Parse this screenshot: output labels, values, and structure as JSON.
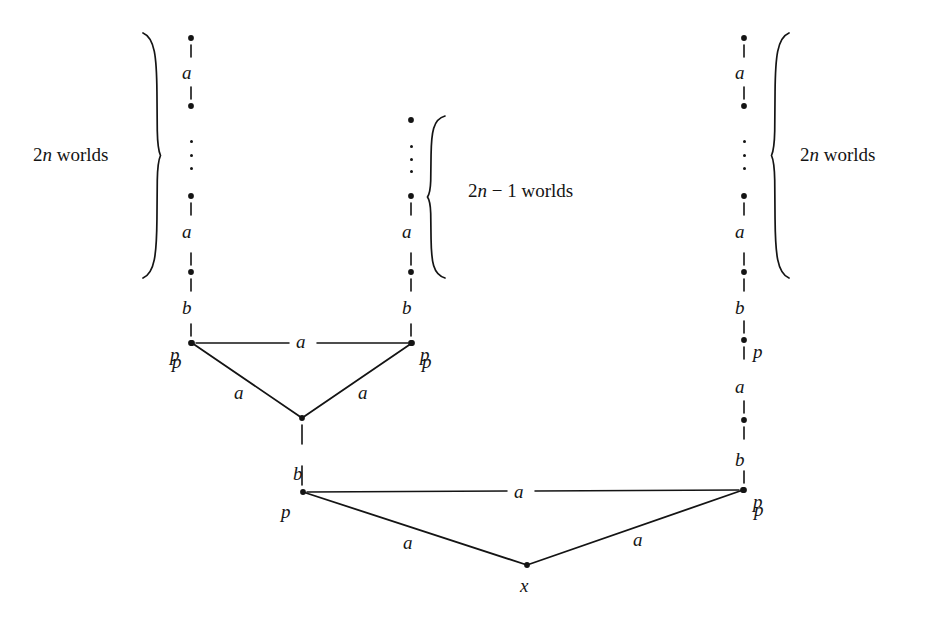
{
  "figure": {
    "type": "kripke-model-diagram",
    "background_color": "#ffffff",
    "ink_color": "#141414",
    "width": 932,
    "height": 628
  },
  "braces": [
    {
      "id": "left-brace",
      "label_parts": {
        "number": "2",
        "variable": "n",
        "word": "worlds"
      },
      "label_text": "2n worlds",
      "side": "right-of-label",
      "x": 160,
      "y_top": 33,
      "y_bottom": 278
    },
    {
      "id": "middle-brace",
      "label_parts": {
        "number": "2",
        "variable": "n",
        "minus": "−",
        "second": "1",
        "word": "worlds"
      },
      "label_text": "2n − 1 worlds",
      "side": "left-of-label",
      "x": 428,
      "y_top": 116,
      "y_bottom": 278
    },
    {
      "id": "right-brace",
      "label_parts": {
        "number": "2",
        "variable": "n",
        "word": "worlds"
      },
      "label_text": "2n worlds",
      "side": "left-of-label",
      "x": 772,
      "y_top": 33,
      "y_bottom": 278
    }
  ],
  "brace_labels": [
    {
      "id": "left-brace-label",
      "prefix": "2",
      "italic": "n",
      "suffix": " worlds",
      "x": 33,
      "y": 145
    },
    {
      "id": "middle-brace-label",
      "prefix": "2",
      "italic": "n",
      "suffix": " − 1 worlds",
      "x": 468,
      "y": 181
    },
    {
      "id": "right-brace-label",
      "prefix": "2",
      "italic": "n",
      "suffix": " worlds",
      "x": 800,
      "y": 145
    }
  ],
  "columns": {
    "left": {
      "id": "left-chain",
      "x": 191,
      "nodes": [
        {
          "y": 38
        },
        {
          "y": 106
        },
        {
          "y": 196
        },
        {
          "y": 272
        },
        {
          "y": 343,
          "label": "p",
          "label_side": "left"
        }
      ],
      "edge_labels": [
        {
          "text": "a",
          "x": 182,
          "y": 63
        },
        {
          "text": "a",
          "x": 182,
          "y": 222
        },
        {
          "text": "b",
          "x": 182,
          "y": 298
        }
      ],
      "dots_column": {
        "x": 189,
        "y": 140,
        "height": 30
      }
    },
    "middle": {
      "id": "middle-chain",
      "x": 411,
      "nodes": [
        {
          "y": 120
        },
        {
          "y": 196
        },
        {
          "y": 272
        },
        {
          "y": 343,
          "label": "p",
          "label_side": "right"
        }
      ],
      "edge_labels": [
        {
          "text": "a",
          "x": 402,
          "y": 222
        },
        {
          "text": "b",
          "x": 402,
          "y": 298
        }
      ],
      "dots_column": {
        "x": 409,
        "y": 145,
        "height": 28
      }
    },
    "right": {
      "id": "right-chain",
      "x": 744,
      "nodes": [
        {
          "y": 38
        },
        {
          "y": 106
        },
        {
          "y": 196
        },
        {
          "y": 272
        },
        {
          "y": 340,
          "label": "p",
          "label_side": "right"
        },
        {
          "y": 420
        },
        {
          "y": 490,
          "label": "p",
          "label_side": "right"
        }
      ],
      "edge_labels": [
        {
          "text": "a",
          "x": 735,
          "y": 63
        },
        {
          "text": "a",
          "x": 735,
          "y": 222
        },
        {
          "text": "b",
          "x": 735,
          "y": 298
        },
        {
          "text": "a",
          "x": 735,
          "y": 377
        },
        {
          "text": "b",
          "x": 735,
          "y": 450
        }
      ],
      "dots_column": {
        "x": 742,
        "y": 140,
        "height": 30
      }
    }
  },
  "vertices": [
    {
      "id": "upper-left-p",
      "x": 192,
      "y": 343,
      "label": "p",
      "label_x": 172,
      "label_y": 352
    },
    {
      "id": "upper-right-p",
      "x": 412,
      "y": 343,
      "label": "p",
      "label_x": 422,
      "label_y": 352
    },
    {
      "id": "upper-apex",
      "x": 302,
      "y": 418,
      "label": "",
      "label_x": 0,
      "label_y": 0
    },
    {
      "id": "lower-left-p",
      "x": 303,
      "y": 492,
      "label": "p",
      "label_x": 281,
      "label_y": 502
    },
    {
      "id": "lower-right-p",
      "x": 743,
      "y": 490,
      "label": "p",
      "label_x": 754,
      "label_y": 500
    },
    {
      "id": "bottom-x",
      "x": 527,
      "y": 565,
      "label": "x",
      "label_x": 520,
      "label_y": 576
    }
  ],
  "edges": [
    {
      "id": "upper-top-edge",
      "from": "upper-left-p",
      "to": "upper-right-p",
      "label": "a",
      "label_x": 296,
      "label_y": 332,
      "gap": 14
    },
    {
      "id": "upper-left-edge",
      "from": "upper-left-p",
      "to": "upper-apex",
      "label": "a",
      "label_x": 234,
      "label_y": 383,
      "gap": 0
    },
    {
      "id": "upper-right-edge",
      "from": "upper-right-p",
      "to": "upper-apex",
      "label": "a",
      "label_x": 358,
      "label_y": 383,
      "gap": 0
    },
    {
      "id": "lower-top-edge",
      "from": "lower-left-p",
      "to": "lower-right-p",
      "label": "a",
      "label_x": 514,
      "label_y": 482,
      "gap": 14
    },
    {
      "id": "lower-left-edge",
      "from": "lower-left-p",
      "to": "bottom-x",
      "label": "a",
      "label_x": 403,
      "label_y": 533,
      "gap": 0
    },
    {
      "id": "lower-right-edge",
      "from": "lower-right-p",
      "to": "bottom-x",
      "label": "a",
      "label_x": 633,
      "label_y": 530,
      "gap": 0
    }
  ],
  "vertical_links": [
    {
      "id": "apex-to-lower-p",
      "x": 302,
      "from_y": 418,
      "to_y": 492,
      "label": "b",
      "label_x": 293,
      "label_y": 464
    }
  ]
}
